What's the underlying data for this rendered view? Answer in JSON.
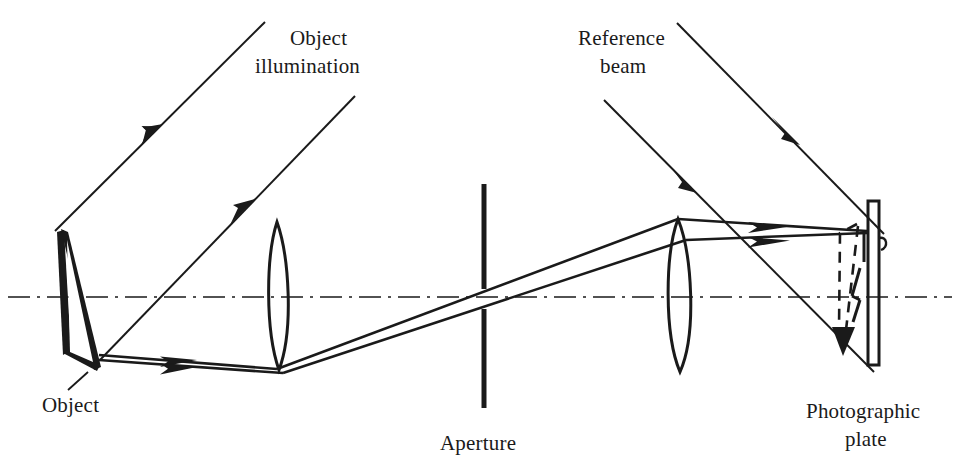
{
  "figure": {
    "kind": "optical-ray-diagram",
    "background_color": "#ffffff",
    "ink_color": "#1a1a1a",
    "width": 959,
    "height": 468
  },
  "labels": {
    "object_illumination": {
      "line1": "Object",
      "line2": "illumination",
      "x": 290,
      "y": 44
    },
    "reference_beam": {
      "line1": "Reference",
      "line2": "beam",
      "x": 645,
      "y": 44
    },
    "object": {
      "line1": "Object",
      "x": 70,
      "y": 400
    },
    "aperture": {
      "line1": "Aperture",
      "x": 498,
      "y": 444
    },
    "photographic_plate": {
      "line1": "Photographic",
      "line2": "plate",
      "x": 866,
      "y": 410
    }
  },
  "components": {
    "optical_axis": {
      "name": "optical-axis",
      "y": 297,
      "x1": 0,
      "x2": 959,
      "style": "dash-dot"
    },
    "object_body": {
      "name": "object",
      "points": "60,231 86,352 66,365 57,290 57,236",
      "outline_points": "60,231 97,369 86,352 66,365",
      "apex_x": 60,
      "apex_y": 231,
      "base_x": 97,
      "base_y": 369
    },
    "lens_one": {
      "name": "objective-lens",
      "cx": 277,
      "cy": 295,
      "top_y": 222,
      "bottom_y": 370,
      "half_width": 17
    },
    "lens_two": {
      "name": "imaging-lens",
      "cx": 678,
      "cy": 290,
      "top_y": 218,
      "bottom_y": 372,
      "half_width": 18
    },
    "aperture_stop": {
      "name": "aperture-stop",
      "x": 484,
      "upper_y1": 184,
      "upper_y2": 288,
      "lower_y1": 308,
      "lower_y2": 408,
      "bar_width": 5
    },
    "photographic_plate": {
      "name": "photographic-plate",
      "x": 868,
      "y": 201,
      "width": 11,
      "height": 164
    },
    "image_dashed": {
      "name": "reconstructed-image",
      "description": "inverted dashed image of the object with arrowhead pointing down",
      "apex_x": 853,
      "apex_y": 225,
      "tip_x": 843,
      "tip_y": 340
    }
  },
  "beams": {
    "object_illumination_rays": [
      {
        "name": "illumination-ray-1",
        "x1": 265,
        "y1": 22,
        "x2": 55,
        "y2": 231,
        "arrow_t": 0.62
      },
      {
        "name": "illumination-ray-2",
        "x1": 355,
        "y1": 96,
        "x2": 100,
        "y2": 360,
        "arrow_t": 0.57
      }
    ],
    "reference_beam_rays": [
      {
        "name": "reference-ray-1",
        "x1": 677,
        "y1": 23,
        "x2": 882,
        "y2": 232,
        "arrow_t": 0.52
      },
      {
        "name": "reference-ray-2",
        "x1": 604,
        "y1": 100,
        "x2": 872,
        "y2": 368,
        "arrow_t": 0.32
      }
    ],
    "object_rays": [
      {
        "name": "object-ray-upper",
        "from_x": 100,
        "from_y": 352,
        "to_x": 277,
        "to_y": 370,
        "arrow_t": 0.5
      },
      {
        "name": "object-ray-lower",
        "from_x": 100,
        "from_y": 361,
        "to_x": 281,
        "to_y": 372,
        "arrow_t": 0.5
      }
    ],
    "collimated_rays": [
      {
        "name": "collimated-ray-upper",
        "x1": 277,
        "y1": 370,
        "x2": 678,
        "y2": 218
      },
      {
        "name": "collimated-ray-lower",
        "x1": 281,
        "y1": 372,
        "x2": 684,
        "y2": 238
      }
    ],
    "converging_rays": [
      {
        "name": "converging-ray-upper",
        "x1": 678,
        "y1": 218,
        "x2": 866,
        "y2": 230,
        "arrow_t": 0.4
      },
      {
        "name": "converging-ray-lower",
        "x1": 684,
        "y1": 238,
        "x2": 866,
        "y2": 232,
        "arrow_t": 0.4
      }
    ]
  }
}
